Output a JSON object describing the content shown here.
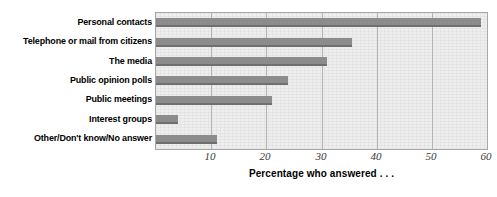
{
  "chart_data": {
    "type": "bar",
    "orientation": "horizontal",
    "title": "",
    "xlabel": "Percentage who answered . . .",
    "ylabel": "",
    "xlim": [
      0,
      60
    ],
    "xticks": [
      10,
      20,
      30,
      40,
      50,
      60
    ],
    "xtick_labels": [
      "10",
      "20",
      "30",
      "40",
      "50",
      "60"
    ],
    "grid": true,
    "grid_axis": "x",
    "legend": false,
    "categories": [
      "Personal contacts",
      "Telephone or mail from citizens",
      "The media",
      "Public opinion polls",
      "Public meetings",
      "Interest groups",
      "Other/Don't know/No answer"
    ],
    "values": [
      59,
      35.5,
      31,
      24,
      21,
      4,
      11
    ],
    "colors": {
      "bar": "#8c8c8c",
      "bar_shadow": "#6f6f6f",
      "plot_background": "#eeeeee",
      "plot_border": "#a8a8a8",
      "gridline": "#b4b4b4",
      "text": "#000000",
      "tick_text": "#3a3a3a"
    }
  }
}
